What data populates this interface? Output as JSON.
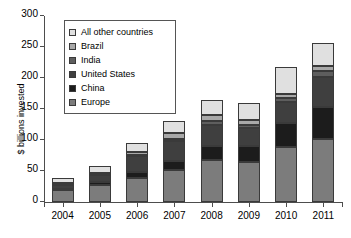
{
  "chart_data": {
    "type": "bar",
    "stacked": true,
    "title": "",
    "xlabel": "",
    "ylabel": "$ billions invested",
    "categories": [
      "2004",
      "2005",
      "2006",
      "2007",
      "2008",
      "2009",
      "2010",
      "2011"
    ],
    "ylim": [
      0,
      300
    ],
    "yticks": [
      0,
      50,
      100,
      150,
      200,
      250,
      300
    ],
    "grid": false,
    "legend_position": "upper-left-inside",
    "series": [
      {
        "name": "Europe",
        "color": "#7c7c7c",
        "values": [
          19,
          28,
          38,
          52,
          68,
          65,
          88,
          101
        ]
      },
      {
        "name": "China",
        "color": "#1c1c1c",
        "values": [
          2,
          4,
          11,
          14,
          22,
          25,
          39,
          52
        ]
      },
      {
        "name": "United States",
        "color": "#3f3f3f",
        "values": [
          7,
          11,
          25,
          32,
          35,
          30,
          34,
          48
        ]
      },
      {
        "name": "India",
        "color": "#5e5e5e",
        "values": [
          1,
          1,
          2,
          4,
          5,
          4,
          6,
          11
        ]
      },
      {
        "name": "Brazil",
        "color": "#a8a8a8",
        "values": [
          1,
          2,
          4,
          9,
          11,
          8,
          8,
          8
        ]
      },
      {
        "name": "All other countries",
        "color": "#e0e0e0",
        "values": [
          8,
          12,
          16,
          19,
          24,
          27,
          43,
          37
        ]
      }
    ],
    "totals": [
      38,
      58,
      96,
      130,
      165,
      159,
      218,
      257
    ],
    "legend_order_top_to_bottom": [
      "All other countries",
      "Brazil",
      "India",
      "United States",
      "China",
      "Europe"
    ]
  },
  "axis": {
    "y_label": "$ billions invested"
  }
}
